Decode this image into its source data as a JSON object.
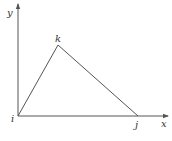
{
  "diagram": {
    "type": "triangle-in-coordinate-system",
    "axes": {
      "x_label": "x",
      "y_label": "y"
    },
    "vertices": [
      {
        "id": "i",
        "label": "i"
      },
      {
        "id": "j",
        "label": "j"
      },
      {
        "id": "k",
        "label": "k"
      }
    ],
    "edges": [
      {
        "from": "i",
        "to": "j"
      },
      {
        "from": "j",
        "to": "k"
      },
      {
        "from": "k",
        "to": "i"
      }
    ],
    "colors": {
      "stroke": "#555555",
      "text": "#333333",
      "background": "#ffffff"
    }
  }
}
